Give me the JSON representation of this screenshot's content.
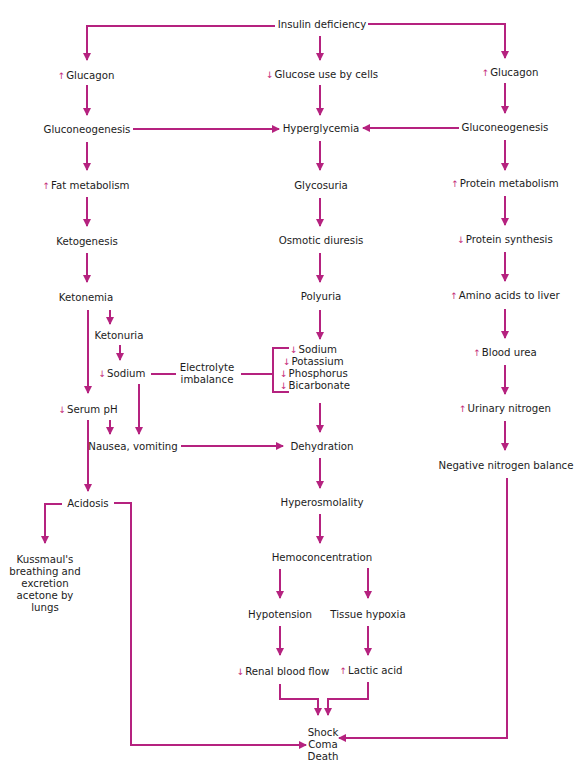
{
  "diagram": {
    "type": "flowchart",
    "title": "",
    "colors": {
      "arrow": "#b5227f",
      "text": "#1c1c1c",
      "indicator": "#c42f7a"
    },
    "indicators": {
      "up": "↑",
      "down": "↓"
    },
    "nodes": {
      "insulin_deficiency": "Insulin deficiency",
      "glucagon_left": "Glucagon",
      "glucose_use": "Glucose use by cells",
      "glucagon_right": "Glucagon",
      "gluconeogenesis_left": "Gluconeogenesis",
      "hyperglycemia": "Hyperglycemia",
      "gluconeogenesis_right": "Gluconeogenesis",
      "fat_metabolism": "Fat metabolism",
      "glycosuria": "Glycosuria",
      "protein_metabolism": "Protein metabolism",
      "ketogenesis": "Ketogenesis",
      "osmotic_diuresis": "Osmotic diuresis",
      "protein_synthesis": "Protein synthesis",
      "ketonemia": "Ketonemia",
      "polyuria": "Polyuria",
      "amino_acids": "Amino acids to liver",
      "ketonuria": "Ketonuria",
      "sodium_left": "Sodium",
      "electrolyte_line1": "Electrolyte",
      "electrolyte_line2": "imbalance",
      "electrolytes": [
        "Sodium",
        "Potassium",
        "Phosphorus",
        "Bicarbonate"
      ],
      "blood_urea": "Blood urea",
      "serum_ph": "Serum pH",
      "urinary_nitrogen": "Urinary nitrogen",
      "nausea": "Nausea, vomiting",
      "dehydration": "Dehydration",
      "negative_nitrogen": "Negative nitrogen balance",
      "acidosis": "Acidosis",
      "hyperosmolality": "Hyperosmolality",
      "kussmaul": [
        "Kussmaul's",
        "breathing and",
        "excretion",
        "acetone by",
        "lungs"
      ],
      "hemoconcentration": "Hemoconcentration",
      "hypotension": "Hypotension",
      "tissue_hypoxia": "Tissue hypoxia",
      "renal_blood_flow": "Renal blood flow",
      "lactic_acid": "Lactic acid",
      "outcome": [
        "Shock",
        "Coma",
        "Death"
      ]
    }
  }
}
